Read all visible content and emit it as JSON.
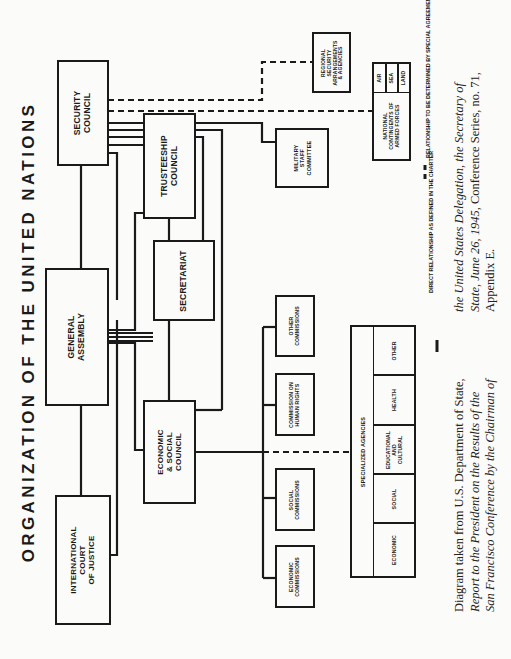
{
  "title": "ORGANIZATION OF THE UNITED NATIONS",
  "organs": {
    "security_council": "SECURITY\nCOUNCIL",
    "general_assembly": "GENERAL\nASSEMBLY",
    "court": "INTERNATIONAL\nCOURT\nOF JUSTICE",
    "trusteeship": "TRUSTEESHIP\nCOUNCIL",
    "secretariat": "SECRETARIAT",
    "ecosoc": "ECONOMIC\n& SOCIAL\nCOUNCIL"
  },
  "subsidiary": {
    "military_staff": "MILITARY\nSTAFF\nCOMMITTEE",
    "regional_security": "REGIONAL\nSECURITY\nARRANGEMENTS\n& AGENCIES",
    "national_contingents": "NATIONAL\nCONTINGENTS OF\nARMED FORCES",
    "armed_forces": [
      "AIR",
      "SEA",
      "LAND"
    ],
    "other_commissions": "OTHER\nCOMMISSIONS",
    "human_rights": "COMMISSION ON\nHUMAN RIGHTS",
    "social_commissions": "SOCIAL\nCOMMISSIONS",
    "economic_commissions": "ECONOMIC\nCOMMISSIONS"
  },
  "specialized_agencies": {
    "label": "SPECIALIZED AGENCIES",
    "categories": [
      "ECONOMIC",
      "SOCIAL",
      "EDUCATIONAL\nAND\nCULTURAL",
      "HEALTH",
      "OTHER"
    ]
  },
  "legend": {
    "direct": "DIRECT RELATIONSHIP AS\nDEFINED IN THE CHARTER",
    "special": "RELATIONSHIP TO BE DETERMINED BY\nSPECIAL AGREEMENTS OR ARRANGEMENTS"
  },
  "caption": {
    "line1_plain": "Diagram taken from U.S. Department of State,",
    "line2_italic": "Report to the President on the Results of the",
    "line3_italic": "San Francisco Conference by the Chairman of",
    "line4_italic": "the United States Delegation, the Secretary of",
    "line5_italic": "State, June 26, 1945,",
    "line5_plain": " Conference Series, no. 71,",
    "line6_plain": "Appendix E."
  },
  "colors": {
    "ink": "#1a1a1a",
    "paper": "#fbfbf9"
  }
}
